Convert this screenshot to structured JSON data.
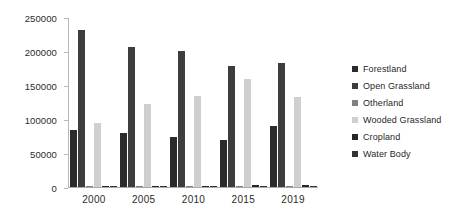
{
  "chart_data": {
    "type": "bar",
    "title": "",
    "xlabel": "",
    "ylabel": "Hectares",
    "ylim": [
      0,
      250000
    ],
    "ytick_labels": [
      "250000",
      "200000",
      "150000",
      "100000",
      "50000",
      "0"
    ],
    "ytick_values": [
      250000,
      200000,
      150000,
      100000,
      50000,
      0
    ],
    "grid": false,
    "legend_position": "right",
    "categories": [
      "2000",
      "2005",
      "2010",
      "2015",
      "2019"
    ],
    "series": [
      {
        "name": "Forestland",
        "color": "#2b2b2b",
        "values": [
          84000,
          79000,
          73500,
          69000,
          90000
        ]
      },
      {
        "name": "Open Grassland",
        "color": "#3d3d3d",
        "values": [
          230500,
          205500,
          199500,
          178500,
          182000
        ]
      },
      {
        "name": "Otherland",
        "color": "#808080",
        "values": [
          1200,
          1300,
          1400,
          1500,
          1500
        ]
      },
      {
        "name": "Wooded Grassland",
        "color": "#cfcfcf",
        "values": [
          94500,
          122500,
          133500,
          158500,
          133000
        ]
      },
      {
        "name": "Cropland",
        "color": "#262626",
        "values": [
          1800,
          2000,
          2200,
          2600,
          2800
        ]
      },
      {
        "name": "Water Body",
        "color": "#333333",
        "values": [
          900,
          950,
          1000,
          1100,
          1100
        ]
      }
    ]
  }
}
